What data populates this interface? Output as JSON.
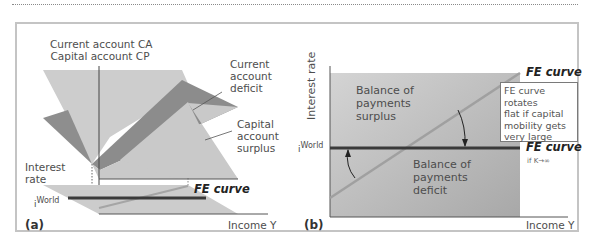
{
  "panel_a": {
    "tag": "(a)",
    "top_label_1": "Current account CA",
    "top_label_2": "Capital account CP",
    "current_account_deficit": [
      "Current",
      "account",
      "deficit"
    ],
    "capital_account_surplus": [
      "Capital",
      "account",
      "surplus"
    ],
    "y_axis_label": [
      "Interest",
      "rate"
    ],
    "world_rate": "i",
    "world_rate_sup": "World",
    "fe_curve_label": "FE curve",
    "x_axis_label": "Income Y"
  },
  "panel_b": {
    "tag": "(b)",
    "y_axis_label": "Interest rate",
    "world_rate": "i",
    "world_rate_sup": "World",
    "surplus_region": [
      "Balance of",
      "payments",
      "surplus"
    ],
    "deficit_region": [
      "Balance of",
      "payments",
      "deficit"
    ],
    "fe_curve_label": "FE curve",
    "fe_flat_label": "FE curve",
    "fe_flat_condition": "if K→∞",
    "note": [
      "FE curve rotates",
      "flat if capital",
      "mobility gets",
      "very large"
    ],
    "x_axis_label": "Income Y"
  },
  "colors": {
    "light_plane": "#cfcfcf",
    "dark_plane": "#8f8f8f",
    "fe_sloped": "#a9a9a9",
    "fe_flat": "#3a3a3a",
    "frame": "#c4c4c4"
  }
}
